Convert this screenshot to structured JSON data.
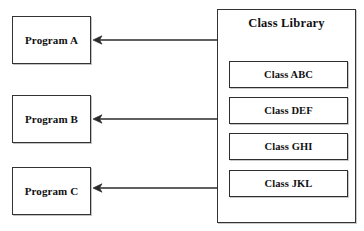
{
  "diagram": {
    "title_visible": false,
    "background_color": "#ffffff",
    "line_color": "#2b2b2b",
    "width": 364,
    "height": 231
  },
  "programs": [
    {
      "label": "Program A",
      "x": 12,
      "y": 16,
      "w": 79,
      "h": 48
    },
    {
      "label": "Program B",
      "x": 12,
      "y": 95,
      "w": 79,
      "h": 48
    },
    {
      "label": "Program C",
      "x": 12,
      "y": 167,
      "w": 79,
      "h": 48
    }
  ],
  "library": {
    "title": "Class Library",
    "x": 217,
    "y": 9,
    "w": 139,
    "h": 214,
    "classes": [
      {
        "label": "Class ABC",
        "x": 229,
        "y": 61,
        "w": 119,
        "h": 27
      },
      {
        "label": "Class DEF",
        "x": 229,
        "y": 97,
        "w": 119,
        "h": 27
      },
      {
        "label": "Class GHI",
        "x": 229,
        "y": 133,
        "w": 119,
        "h": 27
      },
      {
        "label": "Class JKL",
        "x": 229,
        "y": 170,
        "w": 119,
        "h": 27
      }
    ]
  },
  "arrows": [
    {
      "name": "arrow-library-to-program-a",
      "from_x": 218,
      "to_x": 93,
      "y": 40
    },
    {
      "name": "arrow-library-to-program-b",
      "from_x": 218,
      "to_x": 93,
      "y": 119
    },
    {
      "name": "arrow-library-to-program-c",
      "from_x": 218,
      "to_x": 93,
      "y": 188
    }
  ]
}
